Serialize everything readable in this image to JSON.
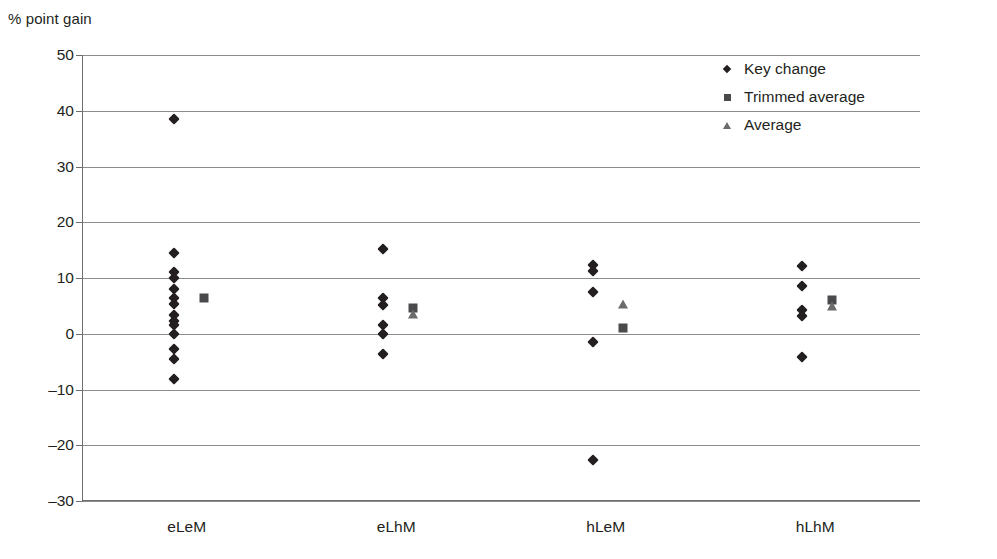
{
  "chart_data": {
    "type": "scatter",
    "title": "",
    "ylabel": "% point gain",
    "xlabel": "",
    "ylim": [
      -30,
      50
    ],
    "ytick_step": 10,
    "yticks": [
      50,
      40,
      30,
      20,
      10,
      0,
      -10,
      -20,
      -30
    ],
    "ytick_labels": [
      "50",
      "40",
      "30",
      "20",
      "10",
      "0",
      "-10",
      "-20",
      "-30"
    ],
    "grid": true,
    "grid_axis": "y",
    "legend_position": "top-right",
    "categories": [
      "eLeM",
      "eLhM",
      "hLeM",
      "hLhM"
    ],
    "legend": [
      {
        "name": "Key change",
        "marker": "diamond",
        "color": "#231f20"
      },
      {
        "name": "Trimmed average",
        "marker": "square",
        "color": "#4a4a4c"
      },
      {
        "name": "Average",
        "marker": "triangle",
        "color": "#6b6b6d"
      }
    ],
    "series": [
      {
        "name": "Key change",
        "marker": "diamond",
        "points": [
          {
            "category": "eLeM",
            "value": 38.5
          },
          {
            "category": "eLeM",
            "value": 14.5
          },
          {
            "category": "eLeM",
            "value": 11.0
          },
          {
            "category": "eLeM",
            "value": 10.0
          },
          {
            "category": "eLeM",
            "value": 8.0
          },
          {
            "category": "eLeM",
            "value": 6.4
          },
          {
            "category": "eLeM",
            "value": 5.3
          },
          {
            "category": "eLeM",
            "value": 3.3
          },
          {
            "category": "eLeM",
            "value": 2.3
          },
          {
            "category": "eLeM",
            "value": 1.5
          },
          {
            "category": "eLeM",
            "value": 0.0
          },
          {
            "category": "eLeM",
            "value": -2.7
          },
          {
            "category": "eLeM",
            "value": -4.6
          },
          {
            "category": "eLeM",
            "value": -8.2
          },
          {
            "category": "eLhM",
            "value": 15.2
          },
          {
            "category": "eLhM",
            "value": 6.5
          },
          {
            "category": "eLhM",
            "value": 5.2
          },
          {
            "category": "eLhM",
            "value": 1.6
          },
          {
            "category": "eLhM",
            "value": 0.0
          },
          {
            "category": "eLhM",
            "value": -3.6
          },
          {
            "category": "hLeM",
            "value": 12.4
          },
          {
            "category": "hLeM",
            "value": 11.3
          },
          {
            "category": "hLeM",
            "value": 7.5
          },
          {
            "category": "hLeM",
            "value": -1.4
          },
          {
            "category": "hLeM",
            "value": -22.7
          },
          {
            "category": "hLhM",
            "value": 12.2
          },
          {
            "category": "hLhM",
            "value": 8.6
          },
          {
            "category": "hLhM",
            "value": 4.3
          },
          {
            "category": "hLhM",
            "value": 3.1
          },
          {
            "category": "hLhM",
            "value": -4.2
          }
        ]
      },
      {
        "name": "Trimmed average",
        "marker": "square",
        "points": [
          {
            "category": "eLeM",
            "value": 6.4
          },
          {
            "category": "eLhM",
            "value": 4.6
          },
          {
            "category": "hLeM",
            "value": 1.1
          },
          {
            "category": "hLhM",
            "value": 6.1
          }
        ]
      },
      {
        "name": "Average",
        "marker": "triangle",
        "points": [
          {
            "category": "eLhM",
            "value": 3.6
          },
          {
            "category": "hLeM",
            "value": 5.4
          },
          {
            "category": "hLhM",
            "value": 5.0
          }
        ]
      }
    ]
  }
}
